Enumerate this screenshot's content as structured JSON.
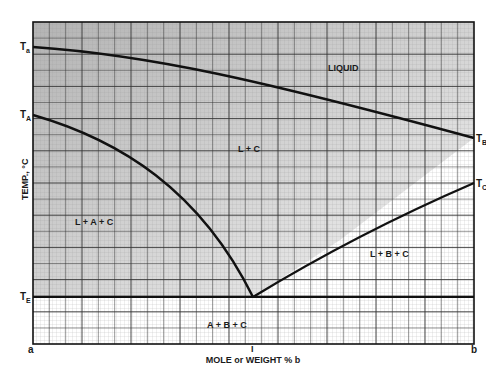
{
  "chart_data": {
    "type": "line",
    "title": "",
    "xlabel": "MOLE or WEIGHT % b",
    "ylabel": "TEMP., °C",
    "x_ticks": [
      "a",
      "I",
      "b"
    ],
    "y_ticks": [
      "Ta",
      "TA",
      "TE"
    ],
    "right_labels": [
      "TB",
      "TC"
    ],
    "regions": [
      {
        "name": "liquid",
        "label": "LIQUID"
      },
      {
        "name": "l-plus-c",
        "label": "L + C"
      },
      {
        "name": "l-plus-a-plus-c",
        "label": "L + A + C"
      },
      {
        "name": "l-plus-b-plus-c",
        "label": "L + B + C"
      },
      {
        "name": "a-plus-b-plus-c",
        "label": "A + B + C"
      }
    ],
    "series": [
      {
        "name": "liquidus Ta-TB",
        "points": [
          [
            0,
            0.92
          ],
          [
            0.5,
            0.8
          ],
          [
            1.0,
            0.64
          ]
        ]
      },
      {
        "name": "A-saturation curve",
        "points": [
          [
            0,
            0.71
          ],
          [
            0.25,
            0.55
          ],
          [
            0.5,
            0.14
          ]
        ]
      },
      {
        "name": "B-saturation curve",
        "points": [
          [
            0.5,
            0.14
          ],
          [
            0.75,
            0.33
          ],
          [
            1.0,
            0.5
          ]
        ]
      },
      {
        "name": "eutectic isotherm TE",
        "points": [
          [
            0,
            0.14
          ],
          [
            1.0,
            0.14
          ]
        ]
      }
    ],
    "xlim": [
      0,
      1
    ],
    "ylim": [
      0,
      1
    ],
    "grid": true
  },
  "labels": {
    "y_axis": "TEMP., °C",
    "x_axis": "MOLE or WEIGHT % b",
    "ta": "T",
    "ta_sub": "a",
    "tA": "T",
    "tA_sub": "A",
    "tE": "T",
    "tE_sub": "E",
    "tB": "T",
    "tB_sub": "B",
    "tC": "T",
    "tC_sub": "C",
    "x_a": "a",
    "x_mid": "I",
    "x_b": "b",
    "liquid": "LIQUID",
    "lc": "L + C",
    "lac": "L + A + C",
    "lbc": "L + B + C",
    "abc": "A + B + C"
  }
}
